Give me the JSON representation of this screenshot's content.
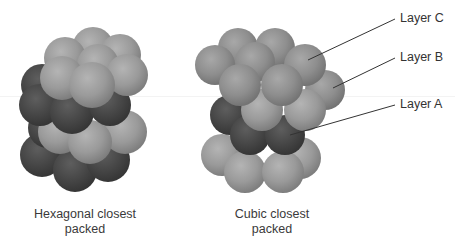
{
  "figure": {
    "hcp": {
      "caption_line1": "Hexagonal closest",
      "caption_line2": "packed",
      "layer_colors": [
        "light",
        "dark",
        "light",
        "dark"
      ]
    },
    "ccp": {
      "caption_line1": "Cubic closest",
      "caption_line2": "packed",
      "layer_colors": [
        "light",
        "light",
        "dark",
        "light"
      ]
    },
    "labels": {
      "layer_c": "Layer C",
      "layer_b": "Layer B",
      "layer_a": "Layer A"
    },
    "colors": {
      "light_sphere": "#9a9a9a",
      "dark_sphere": "#4a4a4a",
      "leader_line": "#333333",
      "text": "#333333"
    }
  }
}
